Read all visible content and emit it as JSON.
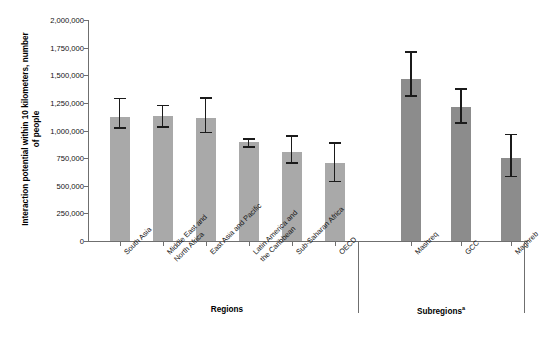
{
  "title_clipped": "",
  "axes": {
    "y_label": "Interaction potential within 10 kilometers, number of people",
    "y_ticks": [
      "2,000,000",
      "1,750,000",
      "1,500,000",
      "1,250,000",
      "1,000,000",
      "750,000",
      "500,000",
      "250,000",
      "0"
    ],
    "group_label_regions": "Regions",
    "group_label_subregions": "Subregions",
    "group_label_subregions_superscript": "a"
  },
  "categories": {
    "c0": [
      "South Asia"
    ],
    "c1": [
      "Middle East and",
      "North Africa"
    ],
    "c2": [
      "East Asia and Pacific"
    ],
    "c3": [
      "Latin America and",
      "the Caribbean"
    ],
    "c4": [
      "Sub-Saharan Africa"
    ],
    "c5": [
      "OECD"
    ],
    "c6": [
      "Mashreq"
    ],
    "c7": [
      "GCC"
    ],
    "c8": [
      "Maghreb"
    ]
  },
  "colors": {
    "bar_regions": "#a9a9a9",
    "bar_subregions": "#8c8c8c",
    "error_bar": "#1b1b1b",
    "axis": "#6f6f6f",
    "text": "#111111"
  },
  "chart_data": {
    "type": "bar",
    "title": "",
    "xlabel": "",
    "ylabel": "Interaction potential within 10 kilometers, number of people",
    "ylim": [
      0,
      2000000
    ],
    "ytick_values": [
      0,
      250000,
      500000,
      750000,
      1000000,
      1250000,
      1500000,
      1750000,
      2000000
    ],
    "grid": false,
    "legend": "none",
    "groups": [
      {
        "name": "Regions",
        "categories": [
          "South Asia",
          "Middle East and North Africa",
          "East Asia and Pacific",
          "Latin America and the Caribbean",
          "Sub-Saharan Africa",
          "OECD"
        ]
      },
      {
        "name": "Subregions",
        "categories": [
          "Mashreq",
          "GCC",
          "Maghreb"
        ]
      }
    ],
    "categories": [
      "South Asia",
      "Middle East and North Africa",
      "East Asia and Pacific",
      "Latin America and the Caribbean",
      "Sub-Saharan Africa",
      "OECD",
      "Mashreq",
      "GCC",
      "Maghreb"
    ],
    "values": [
      1125000,
      1130000,
      1110000,
      895000,
      805000,
      710000,
      1470000,
      1215000,
      750000
    ],
    "error_low": [
      1030000,
      1040000,
      990000,
      860000,
      715000,
      545000,
      1320000,
      1075000,
      590000
    ],
    "error_high": [
      1295000,
      1235000,
      1300000,
      930000,
      960000,
      895000,
      1715000,
      1385000,
      970000
    ],
    "bars": [
      {
        "category": "South Asia",
        "value": 1125000,
        "low": 1030000,
        "high": 1295000,
        "group": "Regions"
      },
      {
        "category": "Middle East and North Africa",
        "value": 1130000,
        "low": 1040000,
        "high": 1235000,
        "group": "Regions"
      },
      {
        "category": "East Asia and Pacific",
        "value": 1110000,
        "low": 990000,
        "high": 1300000,
        "group": "Regions"
      },
      {
        "category": "Latin America and the Caribbean",
        "value": 895000,
        "low": 860000,
        "high": 930000,
        "group": "Regions"
      },
      {
        "category": "Sub-Saharan Africa",
        "value": 805000,
        "low": 715000,
        "high": 960000,
        "group": "Regions"
      },
      {
        "category": "OECD",
        "value": 710000,
        "low": 545000,
        "high": 895000,
        "group": "Regions"
      },
      {
        "category": "Mashreq",
        "value": 1470000,
        "low": 1320000,
        "high": 1715000,
        "group": "Subregions"
      },
      {
        "category": "GCC",
        "value": 1215000,
        "low": 1075000,
        "high": 1385000,
        "group": "Subregions"
      },
      {
        "category": "Maghreb",
        "value": 750000,
        "low": 590000,
        "high": 970000,
        "group": "Subregions"
      }
    ]
  }
}
